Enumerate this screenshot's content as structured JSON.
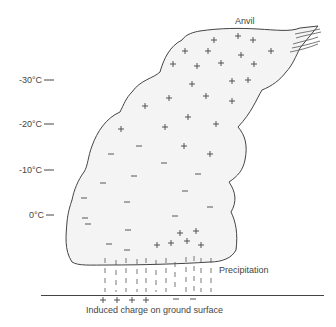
{
  "diagram": {
    "labels": {
      "anvil": "Anvil",
      "precipitation": "Precipitation",
      "ground": "Induced charge on ground surface"
    },
    "temperature_scale": [
      {
        "label": "-30°C",
        "y": 80
      },
      {
        "label": "-20°C",
        "y": 124
      },
      {
        "label": "-10°C",
        "y": 170
      },
      {
        "label": "0°C",
        "y": 215
      }
    ],
    "ground_charges": {
      "positive": [
        "+",
        "+",
        "+",
        "+"
      ],
      "negative": [
        "−",
        "−"
      ]
    },
    "colors": {
      "cloud_fill": "#f4f4f4",
      "outline": "#444444",
      "symbol": "#444444"
    }
  }
}
